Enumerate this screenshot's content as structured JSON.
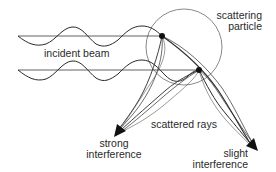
{
  "diagram": {
    "labels": {
      "incident_beam": "incident beam",
      "scattering_particle_line1": "scattering",
      "scattering_particle_line2": "particle",
      "scattered_rays": "scattered rays",
      "strong_line1": "strong",
      "strong_line2": "interference",
      "slight_line1": "slight",
      "slight_line2": "interference"
    },
    "colors": {
      "stroke": "#2a2a2a",
      "circle": "#5a5a5a",
      "background": "#ffffff"
    },
    "nodes": [
      {
        "id": "scatter-point-top",
        "x": 162,
        "y": 36
      },
      {
        "id": "scatter-point-bottom",
        "x": 199,
        "y": 70
      }
    ],
    "edges": [
      {
        "from": "incident-beam-top",
        "to": "scatter-point-top"
      },
      {
        "from": "incident-beam-bottom",
        "to": "scatter-point-bottom"
      },
      {
        "from": "scatter-point-top",
        "to": "strong-interference"
      },
      {
        "from": "scatter-point-bottom",
        "to": "strong-interference"
      },
      {
        "from": "scatter-point-top",
        "to": "slight-interference"
      },
      {
        "from": "scatter-point-bottom",
        "to": "slight-interference"
      }
    ]
  }
}
